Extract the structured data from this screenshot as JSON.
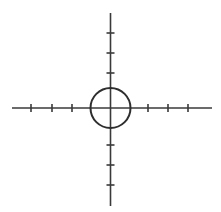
{
  "figure": {
    "canvas": {
      "width": 221,
      "height": 212,
      "background": "#ffffff"
    },
    "stroke_color": "#3a3a3a",
    "circle_stroke_color": "#2e2e2e",
    "axis_stroke_width": 1.6,
    "circle_stroke_width": 2.0,
    "tick_stroke_width": 1.6
  },
  "chart_data": {
    "type": "scatter",
    "xlabel": "",
    "ylabel": "",
    "grid": false,
    "legend": null,
    "center": {
      "x": 110.5,
      "y": 108
    },
    "circle": {
      "cx": 110.5,
      "cy": 108,
      "r": 20
    },
    "axes": {
      "horizontal": {
        "x_start": 12,
        "x_end": 212,
        "y": 108
      },
      "vertical": {
        "y_start": 13,
        "y_end": 206,
        "x": 110.5
      }
    },
    "tick_length": 8,
    "ticks": {
      "left": [
        31,
        52,
        72
      ],
      "right": [
        148,
        168,
        188
      ],
      "top": [
        33,
        53,
        73
      ],
      "bottom": [
        145,
        165,
        185
      ]
    },
    "tick_counts": {
      "left": 3,
      "right": 3,
      "top": 3,
      "bottom": 3
    },
    "x": [
      110.5
    ],
    "values": [
      108
    ]
  }
}
